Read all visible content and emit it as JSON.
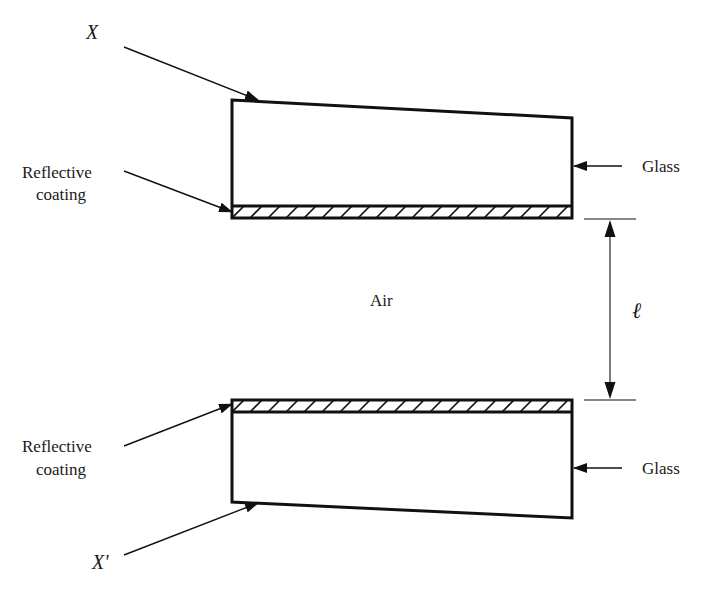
{
  "figure": {
    "type": "optical-cavity-cross-section",
    "labels": {
      "top_edge": "X",
      "bottom_edge": "X'",
      "top_coating": [
        "Reflective",
        "coating"
      ],
      "bottom_coating": [
        "Reflective",
        "coating"
      ],
      "top_material": "Glass",
      "bottom_material": "Glass",
      "gap_medium": "Air",
      "gap_length": "ℓ"
    },
    "colors": {
      "ink": "#111111",
      "background": "#ffffff"
    }
  }
}
